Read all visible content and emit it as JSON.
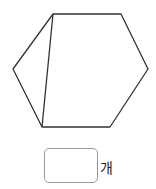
{
  "figure": {
    "shape": "hexagon",
    "stroke_color": "#333333",
    "vertices": [
      [
        53,
        14
      ],
      [
        121,
        14
      ],
      [
        148,
        69
      ],
      [
        110,
        127
      ],
      [
        42,
        127
      ],
      [
        13,
        69
      ]
    ],
    "diagonal": [
      [
        53,
        14
      ],
      [
        42,
        127
      ]
    ]
  },
  "answer": {
    "value": "",
    "unit": "개"
  }
}
